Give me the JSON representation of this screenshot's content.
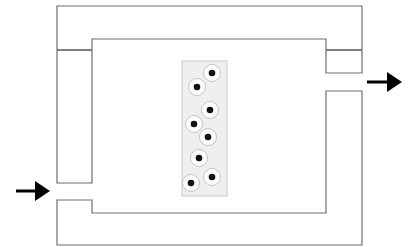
{
  "diagram": {
    "colors": {
      "wall": "#6e6e6e",
      "divider": "#555555",
      "panel_fill": "#efefef",
      "cell_nucleus": "#111111",
      "arrow": "#000000"
    },
    "outer_channel": {
      "outer_rect": {
        "x": 57,
        "y": 6,
        "w": 305,
        "h": 239
      },
      "inner_rect": {
        "x": 92,
        "y": 39,
        "w": 234,
        "h": 174
      },
      "top_divider_y": 50,
      "inlet": {
        "side": "left",
        "gap_top": 183,
        "gap_bottom": 200
      },
      "outlet": {
        "side": "right",
        "gap_top": 73,
        "gap_bottom": 91
      }
    },
    "cell_panel": {
      "x": 182,
      "y": 61,
      "w": 45,
      "h": 135
    },
    "cells": [
      {
        "id": 1,
        "cx": 212,
        "cy": 73
      },
      {
        "id": 2,
        "cx": 197,
        "cy": 87
      },
      {
        "id": 3,
        "cx": 210,
        "cy": 110
      },
      {
        "id": 4,
        "cx": 194,
        "cy": 124
      },
      {
        "id": 5,
        "cx": 208,
        "cy": 137
      },
      {
        "id": 6,
        "cx": 199,
        "cy": 158
      },
      {
        "id": 7,
        "cx": 212,
        "cy": 177
      },
      {
        "id": 8,
        "cx": 191,
        "cy": 183
      }
    ],
    "arrows": [
      {
        "name": "inlet-arrow",
        "direction": "right",
        "x1": 16,
        "x2": 50,
        "y": 191
      },
      {
        "name": "outlet-arrow",
        "direction": "right",
        "x1": 367,
        "x2": 402,
        "y": 82
      }
    ]
  }
}
